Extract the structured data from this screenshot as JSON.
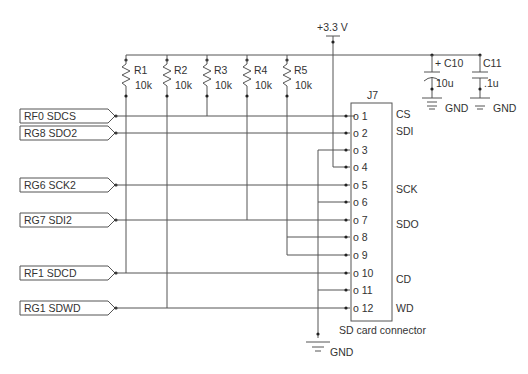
{
  "supply": {
    "label": "+3.3 V"
  },
  "resistors": [
    {
      "ref": "R1",
      "value": "10k"
    },
    {
      "ref": "R2",
      "value": "10k"
    },
    {
      "ref": "R3",
      "value": "10k"
    },
    {
      "ref": "R4",
      "value": "10k"
    },
    {
      "ref": "R5",
      "value": "10k"
    }
  ],
  "capacitors": [
    {
      "ref": "C10",
      "value": "10u",
      "polarity": "+",
      "ground": "GND"
    },
    {
      "ref": "C11",
      "value": ".1u",
      "ground": "GND"
    }
  ],
  "net_labels": [
    {
      "name": "RF0 SDCS"
    },
    {
      "name": "RG8 SDO2"
    },
    {
      "name": "RG6 SCK2"
    },
    {
      "name": "RG7 SDI2"
    },
    {
      "name": "RF1 SDCD"
    },
    {
      "name": "RG1 SDWD"
    }
  ],
  "connector": {
    "ref": "J7",
    "caption": "SD card connector",
    "pins": [
      {
        "num": "o 1",
        "func": "CS"
      },
      {
        "num": "o 2",
        "func": "SDI"
      },
      {
        "num": "o 3",
        "func": ""
      },
      {
        "num": "o 4",
        "func": ""
      },
      {
        "num": "o 5",
        "func": "SCK"
      },
      {
        "num": "o 6",
        "func": ""
      },
      {
        "num": "o 7",
        "func": "SDO"
      },
      {
        "num": "o 8",
        "func": ""
      },
      {
        "num": "o 9",
        "func": ""
      },
      {
        "num": "o 10",
        "func": "CD"
      },
      {
        "num": "o 11",
        "func": ""
      },
      {
        "num": "o 12",
        "func": "WD"
      }
    ]
  },
  "ground": {
    "label": "GND"
  }
}
